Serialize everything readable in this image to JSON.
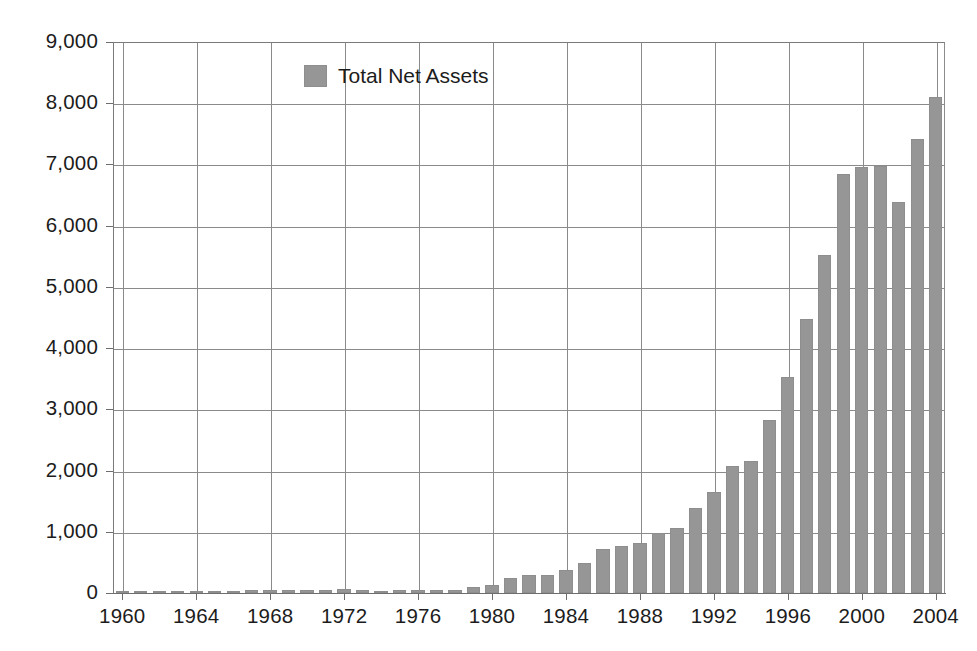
{
  "chart_data": {
    "type": "bar",
    "title": "",
    "subtitle": "",
    "xlabel": "",
    "ylabel": "",
    "ylim": [
      0,
      9000
    ],
    "xlim": [
      1959.5,
      2004.5
    ],
    "grid": true,
    "legend_position": "top-center",
    "y_ticks": [
      "0",
      "1,000",
      "2,000",
      "3,000",
      "4,000",
      "5,000",
      "6,000",
      "7,000",
      "8,000",
      "9,000"
    ],
    "y_tick_values": [
      0,
      1000,
      2000,
      3000,
      4000,
      5000,
      6000,
      7000,
      8000,
      9000
    ],
    "x_ticks": [
      "1960",
      "1964",
      "1968",
      "1972",
      "1976",
      "1980",
      "1984",
      "1988",
      "1992",
      "1996",
      "2000",
      "2004"
    ],
    "x_tick_values": [
      1960,
      1964,
      1968,
      1972,
      1976,
      1980,
      1984,
      1988,
      1992,
      1996,
      2000,
      2004
    ],
    "series": [
      {
        "name": "Total Net Assets",
        "color": "#969696",
        "categories": [
          1960,
          1961,
          1962,
          1963,
          1964,
          1965,
          1966,
          1967,
          1968,
          1969,
          1970,
          1971,
          1972,
          1973,
          1974,
          1975,
          1976,
          1977,
          1978,
          1979,
          1980,
          1981,
          1982,
          1983,
          1984,
          1985,
          1986,
          1987,
          1988,
          1989,
          1990,
          1991,
          1992,
          1993,
          1994,
          1995,
          1996,
          1997,
          1998,
          1999,
          2000,
          2001,
          2002,
          2003,
          2004
        ],
        "values": [
          17,
          23,
          21,
          25,
          29,
          35,
          34,
          45,
          52,
          48,
          47,
          55,
          60,
          47,
          36,
          46,
          51,
          49,
          56,
          95,
          135,
          241,
          297,
          293,
          371,
          495,
          716,
          770,
          810,
          982,
          1065,
          1393,
          1646,
          2070,
          2155,
          2820,
          3526,
          4468,
          5525,
          6846,
          6965,
          6975,
          6392,
          7414,
          8107
        ]
      }
    ],
    "legend": [
      {
        "label": "Total Net Assets",
        "color": "#969696"
      }
    ]
  },
  "legend_entry": {
    "label": "Total Net Assets"
  }
}
